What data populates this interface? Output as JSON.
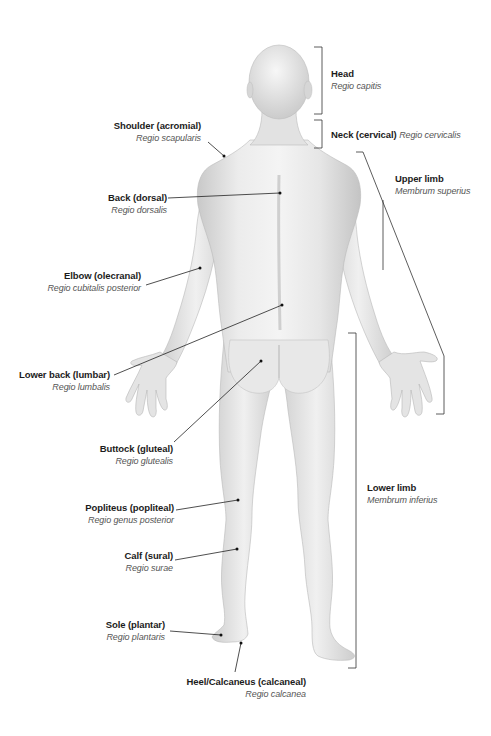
{
  "diagram": {
    "colors": {
      "skin_light": "#f2f2f2",
      "skin_mid": "#dcdcdc",
      "skin_shadow": "#bdbdbd",
      "leader_line": "#222222",
      "label_bold": "#1c1c1c",
      "label_latin": "#555555"
    },
    "labels_left": [
      {
        "id": "shoulder",
        "name": "Shoulder (acromial)",
        "latin": "Regio scapularis"
      },
      {
        "id": "back",
        "name": "Back (dorsal)",
        "latin": "Regio dorsalis"
      },
      {
        "id": "elbow",
        "name": "Elbow (olecranal)",
        "latin": "Regio cubitalis posterior"
      },
      {
        "id": "lower-back",
        "name": "Lower back (lumbar)",
        "latin": "Regio lumbalis"
      },
      {
        "id": "buttock",
        "name": "Buttock (gluteal)",
        "latin": "Regio glutealis"
      },
      {
        "id": "popliteus",
        "name": "Popliteus (popliteal)",
        "latin": "Regio genus posterior"
      },
      {
        "id": "calf",
        "name": "Calf (sural)",
        "latin": "Regio surae"
      },
      {
        "id": "sole",
        "name": "Sole (plantar)",
        "latin": "Regio plantaris"
      },
      {
        "id": "heel",
        "name": "Heel/Calcaneus (calcaneal)",
        "latin": "Regio calcanea"
      }
    ],
    "labels_right": [
      {
        "id": "head",
        "name": "Head",
        "latin": "Regio capitis"
      },
      {
        "id": "neck",
        "name": "Neck (cervical)",
        "latin": "Regio cervicalis"
      },
      {
        "id": "upper-limb",
        "name": "Upper limb",
        "latin": "Membrum superius"
      },
      {
        "id": "lower-limb",
        "name": "Lower limb",
        "latin": "Membrum inferius"
      }
    ]
  }
}
